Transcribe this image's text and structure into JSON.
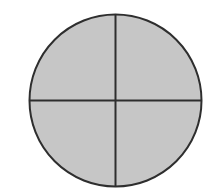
{
  "diagram": {
    "type": "circle-divided-into-quarters",
    "parts": 4,
    "shaded_parts": 4,
    "fill_color": "#c6c6c6",
    "stroke_color": "#2e2e2e",
    "background_color": "#ffffff",
    "circle": {
      "cx": 115.5,
      "cy": 100.5,
      "r": 86
    },
    "dividers": [
      {
        "orientation": "vertical",
        "x": 115.5
      },
      {
        "orientation": "horizontal",
        "y": 100.5
      }
    ]
  }
}
